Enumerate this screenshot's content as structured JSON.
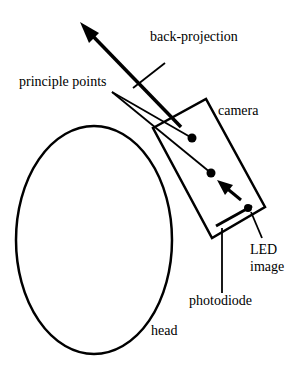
{
  "diagram": {
    "labels": {
      "back_projection": "back-projection",
      "principle_points": "principle points",
      "camera": "camera",
      "led_line1": "LED",
      "led_line2": "image",
      "photodiode": "photodiode",
      "head": "head"
    },
    "colors": {
      "stroke": "#000000",
      "background": "#ffffff"
    }
  }
}
